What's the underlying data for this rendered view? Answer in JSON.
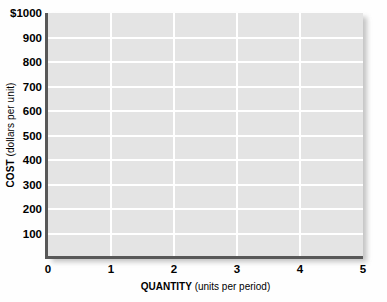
{
  "chart_data": {
    "type": "line",
    "title": "",
    "subtitle": "",
    "xlabel_bold": "QUANTITY",
    "xlabel_units": " (units per period)",
    "ylabel_bold": "COST",
    "ylabel_units": " (dollars per unit)",
    "xlim": [
      0,
      5
    ],
    "ylim": [
      0,
      1000
    ],
    "xticks": [
      0,
      1,
      2,
      3,
      4,
      5
    ],
    "xtick_labels": [
      "0",
      "1",
      "2",
      "3",
      "4",
      "5"
    ],
    "yticks": [
      100,
      200,
      300,
      400,
      500,
      600,
      700,
      800,
      900,
      1000
    ],
    "ytick_labels": [
      "100",
      "200",
      "300",
      "400",
      "500",
      "600",
      "700",
      "800",
      "900",
      "$1000"
    ],
    "grid": true,
    "grid_color": "#ffffff",
    "plot_background": "#e4e4e4",
    "axis_color": "#585858",
    "legend": [],
    "annotations": [],
    "series": [],
    "note": "Empty blank grid — no data series plotted"
  },
  "colors": {
    "page_background": "#fefefe",
    "plot_fill": "#e4e4e4",
    "gridline": "#ffffff",
    "axis_line": "#585858",
    "text": "#000000"
  }
}
